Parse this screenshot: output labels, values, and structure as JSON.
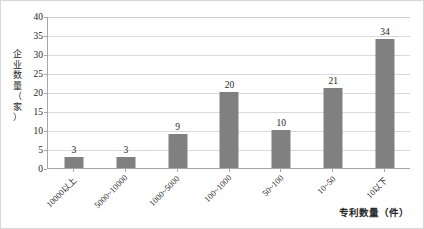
{
  "chart_data": {
    "type": "bar",
    "title": "",
    "subtitle": "",
    "xlabel": "专利数量（件）",
    "ylabel": "企业数量（家）",
    "categories": [
      "10000以上",
      "5000~10000",
      "1000~5000",
      "100~1000",
      "50~100",
      "10~50",
      "10以下"
    ],
    "values": [
      3,
      3,
      9,
      20,
      10,
      21,
      34
    ],
    "data_labels": [
      "3",
      "3",
      "9",
      "20",
      "10",
      "21",
      "34"
    ],
    "ylim": [
      0,
      40
    ],
    "ytick_step": 5,
    "ytick_labels": [
      "0",
      "5",
      "10",
      "15",
      "20",
      "25",
      "30",
      "35",
      "40"
    ],
    "grid": "horizontal",
    "legend": "none",
    "bar_color": "#808080",
    "gridline_color": "#d9d9d9",
    "axis_color": "#a6a6a6",
    "text_color": "#262626",
    "background": "#ffffff",
    "xlabel_rotation": -45,
    "ylabel_orientation": "vertical-cjk"
  },
  "ylabel_chars": [
    "企",
    "业",
    "数",
    "量",
    "（",
    "家",
    "）"
  ]
}
